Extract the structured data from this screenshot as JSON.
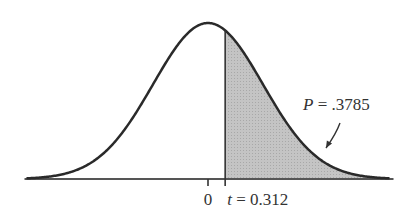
{
  "chart_data": {
    "type": "area",
    "title": "",
    "distribution": "t (approximately standard normal)",
    "xlabel": "",
    "ylabel": "",
    "x_range": [
      -3.3,
      3.3
    ],
    "mean": 0,
    "t_value": 0.312,
    "shaded_region": "right tail, t > 0.312",
    "p_value": 0.3785,
    "tick_labels": [
      {
        "x": 0,
        "label": "0"
      },
      {
        "x": 0.312,
        "label_var": "t",
        "label_eq": " = 0.312"
      }
    ],
    "annotation": {
      "var": "P",
      "text": " = .3785"
    },
    "grid": false,
    "legend": "none"
  },
  "colors": {
    "curve": "#2a2a2a",
    "shade": "#bdbdbd",
    "axis": "#555555",
    "text": "#333333"
  }
}
